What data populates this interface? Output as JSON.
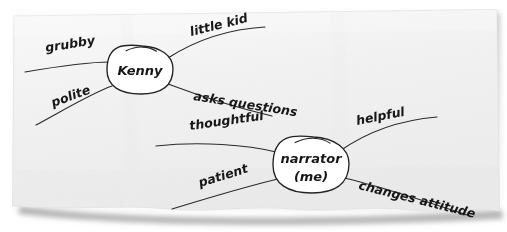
{
  "page": {
    "medium": "photographed paper sheet",
    "background_color": "#ffffff",
    "paper_color": "#f4f4f4",
    "ink_color": "#232327",
    "width": 507,
    "height": 232
  },
  "nodes": [
    {
      "id": "kenny",
      "label": "Kenny",
      "label_line1": "Kenny",
      "label_line2": "",
      "cx": 140,
      "cy": 70,
      "rx": 33,
      "ry": 24
    },
    {
      "id": "narrator",
      "label": "narrator (me)",
      "label_line1": "narrator",
      "label_line2": "(me)",
      "cx": 311,
      "cy": 165,
      "rx": 38,
      "ry": 28
    }
  ],
  "branches": [
    {
      "id": "grubby",
      "label": "grubby",
      "node": "kenny",
      "side": "left-upper",
      "label_x": 46,
      "label_y": 52,
      "label_rotation": -9,
      "path": "M 25 72 C 60 66, 92 62, 110 62"
    },
    {
      "id": "little-kid",
      "label": "little kid",
      "node": "kenny",
      "side": "right-upper",
      "label_x": 191,
      "label_y": 36,
      "label_rotation": -14,
      "path": "M 168 58 C 196 40, 230 29, 265 27"
    },
    {
      "id": "polite",
      "label": "polite",
      "node": "kenny",
      "side": "left-lower",
      "label_x": 53,
      "label_y": 107,
      "label_rotation": -20,
      "path": "M 112 86 C 92 93, 62 111, 36 125"
    },
    {
      "id": "asks-questions",
      "label": "asks questions",
      "node": "kenny",
      "side": "right-lower",
      "label_x": 193,
      "label_y": 100,
      "label_rotation": 9,
      "path": "M 168 84 C 200 96, 238 108, 272 116"
    },
    {
      "id": "thoughtful",
      "label": "thoughtful",
      "node": "narrator",
      "side": "left-upper",
      "label_x": 190,
      "label_y": 130,
      "label_rotation": -8,
      "path": "M 156 146 C 200 141, 248 145, 276 152"
    },
    {
      "id": "helpful",
      "label": "helpful",
      "node": "narrator",
      "side": "right-upper",
      "label_x": 357,
      "label_y": 125,
      "label_rotation": -11,
      "path": "M 340 151 C 368 131, 402 120, 437 117"
    },
    {
      "id": "patient",
      "label": "patient",
      "node": "narrator",
      "side": "left-lower",
      "label_x": 200,
      "label_y": 187,
      "label_rotation": -17,
      "path": "M 278 179 C 248 186, 208 198, 172 209"
    },
    {
      "id": "changes-attitude",
      "label": "changes attitude",
      "node": "narrator",
      "side": "right-lower",
      "label_x": 358,
      "label_y": 189,
      "label_rotation": 14,
      "path": "M 344 178 C 380 186, 428 202, 470 216"
    }
  ],
  "paper": {
    "corner_top_left": "14,16",
    "corner_top_right": "497,10",
    "corner_bottom_right": "499,212",
    "corner_bottom_left": "12,207",
    "edge_style": "torn-bottom",
    "rotation_degrees": -0.7
  }
}
